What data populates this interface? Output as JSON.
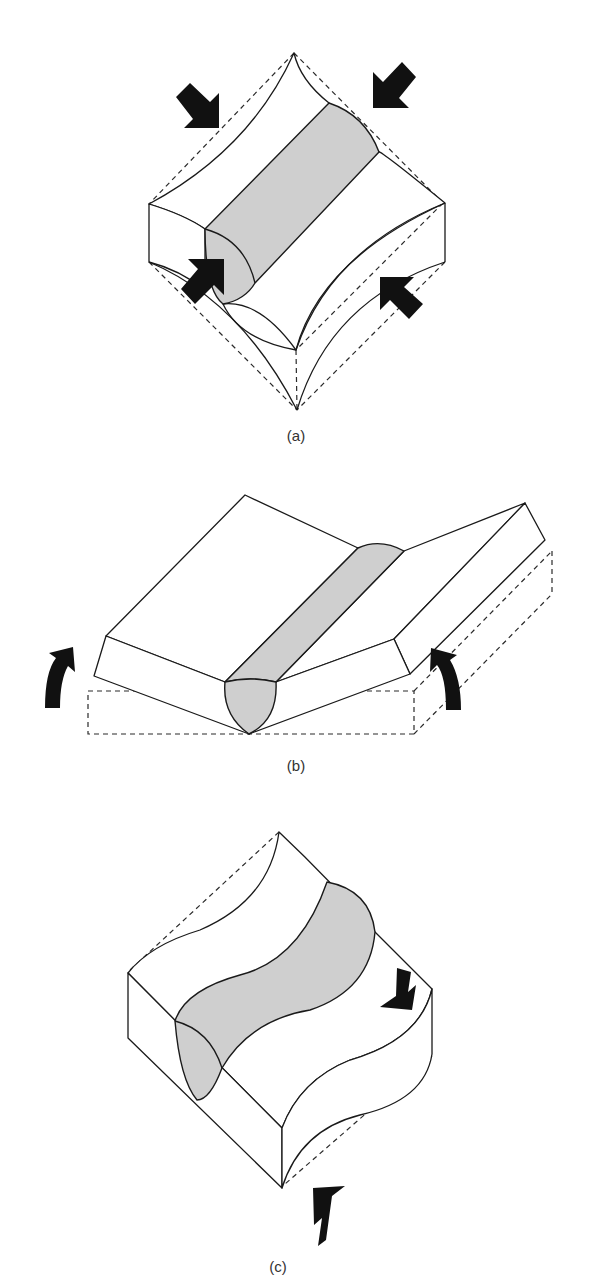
{
  "figure": {
    "panels": [
      {
        "id": "a",
        "label": "(a)",
        "description": "Weld bead in a plate under biaxial compression; four block arrows push inward on the edges, causing concave (buckled) edges relative to dashed original outline",
        "arrows": [
          "compression-arrow",
          "compression-arrow",
          "compression-arrow",
          "compression-arrow"
        ]
      },
      {
        "id": "b",
        "label": "(b)",
        "description": "Butt-welded plates bending upward (angular distortion); dashed outline shows original flat position, curved arrows show rotation",
        "arrows": [
          "rotation-arrow-left",
          "rotation-arrow-right"
        ]
      },
      {
        "id": "c",
        "label": "(c)",
        "description": "Weld bead with S-shaped distortion under opposing shear arrows; dashed lines show original straight edges",
        "arrows": [
          "shear-arrow-down",
          "shear-arrow-up"
        ]
      }
    ],
    "colors": {
      "line": "#1a1a1a",
      "weld_fill": "#cfcfcf",
      "arrow_fill": "#111111",
      "background": "#ffffff"
    }
  }
}
